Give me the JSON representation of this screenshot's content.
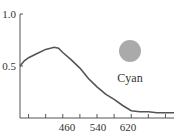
{
  "chart_data": {
    "type": "line",
    "title": "",
    "xlabel": "",
    "ylabel": "",
    "x_ticks": [
      460,
      540,
      620
    ],
    "y_ticks": [
      0.5,
      1.0
    ],
    "y_tick_labels": [
      "0.5",
      "1.0"
    ],
    "x_tick_labels": [
      "460",
      "540",
      "620"
    ],
    "xlim": [
      380,
      740
    ],
    "ylim": [
      0,
      1.0
    ],
    "grid": false,
    "series": [
      {
        "name": "Cyan",
        "color": "#555555",
        "x": [
          380,
          390,
          400,
          420,
          440,
          460,
          470,
          480,
          500,
          520,
          540,
          560,
          580,
          600,
          620,
          640,
          660,
          680,
          700,
          720,
          740
        ],
        "values": [
          0.5,
          0.55,
          0.58,
          0.62,
          0.66,
          0.68,
          0.67,
          0.63,
          0.56,
          0.48,
          0.38,
          0.3,
          0.23,
          0.18,
          0.12,
          0.07,
          0.06,
          0.06,
          0.05,
          0.05,
          0.05
        ]
      }
    ],
    "legend": {
      "label": "Cyan",
      "swatch_color": "#aaaaaa",
      "position": "upper-right"
    }
  }
}
